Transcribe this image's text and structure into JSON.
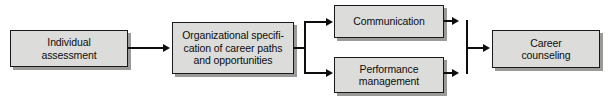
{
  "diagram": {
    "type": "flowchart",
    "colors": {
      "node_fill": "#dcdcda",
      "node_border": "#1a1a1a",
      "shadow": "#9a9a98",
      "connector": "#0d0d0d",
      "background": "#ffffff"
    },
    "nodes": [
      {
        "id": "individual-assessment",
        "label": "Individual\nassessment"
      },
      {
        "id": "organizational-specification",
        "label": "Organizational specifi-\ncation of career paths\nand opportunities"
      },
      {
        "id": "communication",
        "label": "Communication"
      },
      {
        "id": "performance-management",
        "label": "Performance\nmanagement"
      },
      {
        "id": "career-counseling",
        "label": "Career\ncounseling"
      }
    ],
    "edges": [
      {
        "from": "individual-assessment",
        "to": "organizational-specification"
      },
      {
        "from": "organizational-specification",
        "to": "communication"
      },
      {
        "from": "organizational-specification",
        "to": "performance-management"
      },
      {
        "from": "communication",
        "to": "career-counseling"
      },
      {
        "from": "performance-management",
        "to": "career-counseling"
      }
    ]
  }
}
